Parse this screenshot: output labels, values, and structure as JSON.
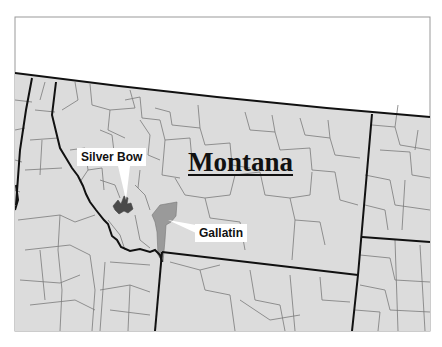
{
  "map": {
    "title": "Montana",
    "colors": {
      "background": "#ffffff",
      "land": "#dcdcdc",
      "county_border": "#777777",
      "state_border": "#111111",
      "frame": "#999999",
      "silver_bow_fill": "#4a4a4a",
      "gallatin_fill": "#9a9a9a",
      "label_bg": "#ffffff"
    },
    "highlighted_counties": [
      {
        "name": "Silver Bow",
        "shade": "dark gray"
      },
      {
        "name": "Gallatin",
        "shade": "medium gray"
      }
    ],
    "labels": {
      "silver_bow": "Silver Bow",
      "gallatin": "Gallatin"
    }
  }
}
